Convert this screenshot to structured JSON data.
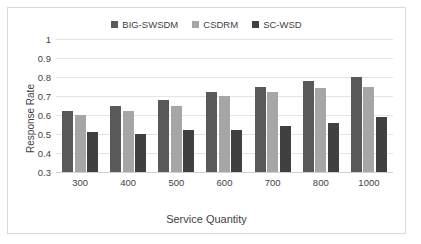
{
  "chart_data": {
    "type": "bar",
    "title": "",
    "xlabel": "Service Quantity",
    "ylabel": "Response Rate",
    "categories": [
      "300",
      "400",
      "500",
      "600",
      "700",
      "800",
      "1000"
    ],
    "series": [
      {
        "name": "BIG-SWSDM",
        "color": "#595959",
        "values": [
          0.62,
          0.65,
          0.68,
          0.72,
          0.75,
          0.78,
          0.8
        ]
      },
      {
        "name": "CSDRM",
        "color": "#a6a6a6",
        "values": [
          0.6,
          0.62,
          0.65,
          0.7,
          0.72,
          0.74,
          0.75
        ]
      },
      {
        "name": "SC-WSD",
        "color": "#404040",
        "values": [
          0.51,
          0.5,
          0.52,
          0.52,
          0.54,
          0.56,
          0.59
        ]
      }
    ],
    "ylim": [
      0.3,
      1.0
    ],
    "yticks": [
      "1",
      "0.9",
      "0.8",
      "0.7",
      "0.6",
      "0.5",
      "0.4",
      "0.3"
    ],
    "grid": true,
    "legend_position": "top-center"
  }
}
